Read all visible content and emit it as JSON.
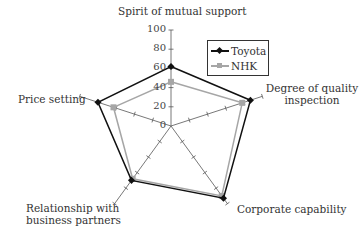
{
  "chart_data": {
    "type": "radar",
    "title": "",
    "axes": [
      "Spirit of mutual support",
      "Degree of quality inspection",
      "Corporate capability",
      "Relationship with business partners",
      "Price setting"
    ],
    "axis_labels_display": [
      [
        "Spirit of mutual support"
      ],
      [
        "Degree of quality",
        "inspection"
      ],
      [
        "Corporate capability"
      ],
      [
        "Relationship with",
        "business partners"
      ],
      [
        "Price setting"
      ]
    ],
    "radial_ticks": [
      0,
      20,
      40,
      60,
      80,
      100
    ],
    "rlim": [
      0,
      100
    ],
    "series": [
      {
        "name": "Toyota",
        "values": [
          62,
          87,
          93,
          70,
          80
        ],
        "color": "#111111",
        "marker": "diamond"
      },
      {
        "name": "NHK",
        "values": [
          46,
          78,
          90,
          68,
          63
        ],
        "color": "#a6a6a6",
        "marker": "square"
      }
    ],
    "legend_position": "upper right",
    "grid": false
  }
}
